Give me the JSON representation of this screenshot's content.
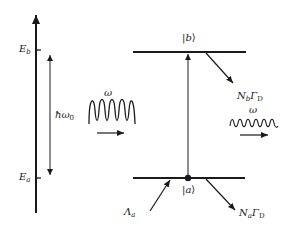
{
  "diagram": {
    "type": "energy-level-diagram",
    "energy_axis": {
      "levels": [
        {
          "id": "Eb",
          "symbol": "E",
          "subscript": "b"
        },
        {
          "id": "Ea",
          "symbol": "E",
          "subscript": "a"
        }
      ]
    },
    "transition_energy": {
      "symbol": "ħω",
      "subscript": "0"
    },
    "states": {
      "upper": {
        "ket_open": "|",
        "ket_label": "b",
        "ket_close": "⟩"
      },
      "lower": {
        "ket_open": "|",
        "ket_label": "a",
        "ket_close": "⟩"
      }
    },
    "incoming_field": {
      "label": "ω"
    },
    "outgoing_field": {
      "label": "ω"
    },
    "decay_upper": {
      "N": "N",
      "N_sub": "b",
      "Gamma": "Γ",
      "Gamma_sub": "D"
    },
    "decay_lower": {
      "N": "N",
      "N_sub": "a",
      "Gamma": "Γ",
      "Gamma_sub": "D"
    },
    "pump": {
      "symbol": "Λ",
      "subscript": "a"
    },
    "colors": {
      "line": "#1a1a1a",
      "background": "#ffffff"
    }
  }
}
